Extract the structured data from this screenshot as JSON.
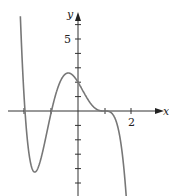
{
  "chart_data": {
    "type": "line",
    "title": "",
    "xlabel": "x",
    "ylabel": "y",
    "xlim": [
      -2.2,
      3.2
    ],
    "ylim": [
      -5.9,
      6.7
    ],
    "grid": false,
    "legend": null,
    "x_ticks": [
      -2,
      -1,
      1,
      2
    ],
    "x_tick_labels": [
      {
        "value": 2,
        "label": "2"
      }
    ],
    "y_ticks": [
      -5,
      -4,
      -3,
      -2,
      -1,
      1,
      2,
      3,
      4,
      5,
      6
    ],
    "y_tick_labels": [
      {
        "value": 5,
        "label": "5"
      }
    ],
    "series": [
      {
        "name": "f(x)",
        "color": "#777777",
        "description": "Polynomial curve with roots at x=-2, x=-1, and flat inflection root at x=1; local min ~(-1.65,-4.2), local max ~(-0.4,2.6), y-intercept 2",
        "points": [
          {
            "x": -2.1,
            "y": 6.5
          },
          {
            "x": -2.0,
            "y": 0
          },
          {
            "x": -1.65,
            "y": -4.2
          },
          {
            "x": -1.0,
            "y": 0
          },
          {
            "x": -0.4,
            "y": 2.6
          },
          {
            "x": 0,
            "y": 2
          },
          {
            "x": 1.0,
            "y": 0
          },
          {
            "x": 1.8,
            "y": -6
          }
        ]
      }
    ]
  },
  "labels": {
    "x_axis": "x",
    "y_axis": "y",
    "y_tick_5": "5",
    "x_tick_2": "2"
  }
}
